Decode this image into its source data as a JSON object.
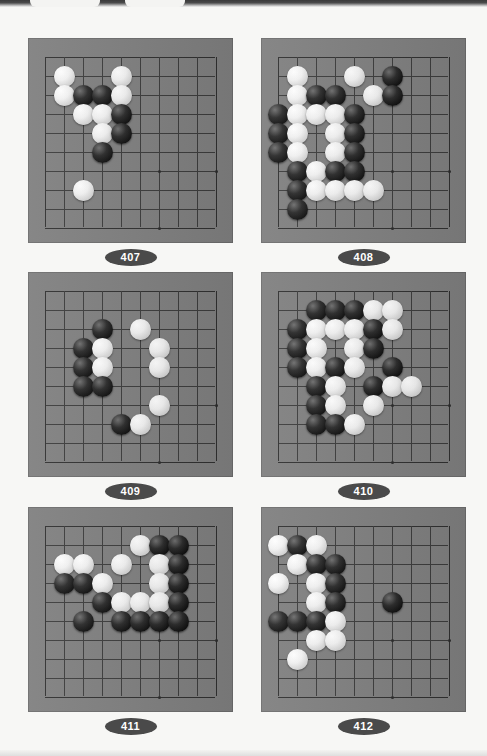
{
  "page": {
    "background_color": "#f7f7f5",
    "board_color": "#7f7f7f",
    "line_color": "#3b3b3b",
    "label_pill_color": "#4a4a4a",
    "label_text_color": "#ffffff",
    "black_stone_color": "#0c0c0c",
    "white_stone_color": "#f2f2f2"
  },
  "board_spec": {
    "cols": 10,
    "rows": 10,
    "cell_px": 19,
    "note": "Each diagram shows a 10x10 visible section of a Go board with a corner/edge area."
  },
  "problems": [
    {
      "number": "407",
      "label": "407",
      "stones": [
        {
          "color": "white",
          "col": 1,
          "row": 1
        },
        {
          "color": "white",
          "col": 4,
          "row": 1
        },
        {
          "color": "white",
          "col": 1,
          "row": 2
        },
        {
          "color": "black",
          "col": 2,
          "row": 2
        },
        {
          "color": "black",
          "col": 3,
          "row": 2
        },
        {
          "color": "white",
          "col": 4,
          "row": 2
        },
        {
          "color": "white",
          "col": 2,
          "row": 3
        },
        {
          "color": "white",
          "col": 3,
          "row": 3
        },
        {
          "color": "black",
          "col": 4,
          "row": 3
        },
        {
          "color": "white",
          "col": 3,
          "row": 4
        },
        {
          "color": "black",
          "col": 4,
          "row": 4
        },
        {
          "color": "black",
          "col": 3,
          "row": 5
        },
        {
          "color": "white",
          "col": 2,
          "row": 7
        }
      ]
    },
    {
      "number": "408",
      "label": "408",
      "stones": [
        {
          "color": "white",
          "col": 1,
          "row": 1
        },
        {
          "color": "white",
          "col": 4,
          "row": 1
        },
        {
          "color": "black",
          "col": 6,
          "row": 1
        },
        {
          "color": "white",
          "col": 1,
          "row": 2
        },
        {
          "color": "black",
          "col": 2,
          "row": 2
        },
        {
          "color": "black",
          "col": 3,
          "row": 2
        },
        {
          "color": "white",
          "col": 5,
          "row": 2
        },
        {
          "color": "black",
          "col": 6,
          "row": 2
        },
        {
          "color": "black",
          "col": 0,
          "row": 3
        },
        {
          "color": "white",
          "col": 1,
          "row": 3
        },
        {
          "color": "white",
          "col": 2,
          "row": 3
        },
        {
          "color": "white",
          "col": 3,
          "row": 3
        },
        {
          "color": "black",
          "col": 4,
          "row": 3
        },
        {
          "color": "black",
          "col": 0,
          "row": 4
        },
        {
          "color": "white",
          "col": 1,
          "row": 4
        },
        {
          "color": "white",
          "col": 3,
          "row": 4
        },
        {
          "color": "black",
          "col": 4,
          "row": 4
        },
        {
          "color": "black",
          "col": 0,
          "row": 5
        },
        {
          "color": "white",
          "col": 1,
          "row": 5
        },
        {
          "color": "white",
          "col": 3,
          "row": 5
        },
        {
          "color": "black",
          "col": 4,
          "row": 5
        },
        {
          "color": "black",
          "col": 1,
          "row": 6
        },
        {
          "color": "white",
          "col": 2,
          "row": 6
        },
        {
          "color": "black",
          "col": 3,
          "row": 6
        },
        {
          "color": "black",
          "col": 4,
          "row": 6
        },
        {
          "color": "black",
          "col": 1,
          "row": 7
        },
        {
          "color": "white",
          "col": 2,
          "row": 7
        },
        {
          "color": "white",
          "col": 3,
          "row": 7
        },
        {
          "color": "white",
          "col": 4,
          "row": 7
        },
        {
          "color": "white",
          "col": 5,
          "row": 7
        },
        {
          "color": "black",
          "col": 1,
          "row": 8
        }
      ]
    },
    {
      "number": "409",
      "label": "409",
      "stones": [
        {
          "color": "black",
          "col": 3,
          "row": 2
        },
        {
          "color": "white",
          "col": 5,
          "row": 2
        },
        {
          "color": "black",
          "col": 2,
          "row": 3
        },
        {
          "color": "white",
          "col": 3,
          "row": 3
        },
        {
          "color": "white",
          "col": 6,
          "row": 3
        },
        {
          "color": "black",
          "col": 2,
          "row": 4
        },
        {
          "color": "white",
          "col": 3,
          "row": 4
        },
        {
          "color": "white",
          "col": 6,
          "row": 4
        },
        {
          "color": "black",
          "col": 2,
          "row": 5
        },
        {
          "color": "black",
          "col": 3,
          "row": 5
        },
        {
          "color": "white",
          "col": 6,
          "row": 6
        },
        {
          "color": "black",
          "col": 4,
          "row": 7
        },
        {
          "color": "white",
          "col": 5,
          "row": 7
        }
      ]
    },
    {
      "number": "410",
      "label": "410",
      "stones": [
        {
          "color": "black",
          "col": 2,
          "row": 1
        },
        {
          "color": "black",
          "col": 3,
          "row": 1
        },
        {
          "color": "black",
          "col": 4,
          "row": 1
        },
        {
          "color": "white",
          "col": 5,
          "row": 1
        },
        {
          "color": "white",
          "col": 6,
          "row": 1
        },
        {
          "color": "black",
          "col": 1,
          "row": 2
        },
        {
          "color": "white",
          "col": 2,
          "row": 2
        },
        {
          "color": "white",
          "col": 3,
          "row": 2
        },
        {
          "color": "white",
          "col": 4,
          "row": 2
        },
        {
          "color": "black",
          "col": 5,
          "row": 2
        },
        {
          "color": "white",
          "col": 6,
          "row": 2
        },
        {
          "color": "black",
          "col": 1,
          "row": 3
        },
        {
          "color": "white",
          "col": 2,
          "row": 3
        },
        {
          "color": "white",
          "col": 4,
          "row": 3
        },
        {
          "color": "black",
          "col": 5,
          "row": 3
        },
        {
          "color": "black",
          "col": 1,
          "row": 4
        },
        {
          "color": "white",
          "col": 2,
          "row": 4
        },
        {
          "color": "black",
          "col": 3,
          "row": 4
        },
        {
          "color": "white",
          "col": 4,
          "row": 4
        },
        {
          "color": "black",
          "col": 6,
          "row": 4
        },
        {
          "color": "black",
          "col": 2,
          "row": 5
        },
        {
          "color": "white",
          "col": 3,
          "row": 5
        },
        {
          "color": "black",
          "col": 5,
          "row": 5
        },
        {
          "color": "white",
          "col": 6,
          "row": 5
        },
        {
          "color": "white",
          "col": 7,
          "row": 5
        },
        {
          "color": "black",
          "col": 2,
          "row": 6
        },
        {
          "color": "white",
          "col": 3,
          "row": 6
        },
        {
          "color": "white",
          "col": 5,
          "row": 6
        },
        {
          "color": "black",
          "col": 2,
          "row": 7
        },
        {
          "color": "black",
          "col": 3,
          "row": 7
        },
        {
          "color": "white",
          "col": 4,
          "row": 7
        }
      ]
    },
    {
      "number": "411",
      "label": "411",
      "stones": [
        {
          "color": "white",
          "col": 5,
          "row": 1
        },
        {
          "color": "black",
          "col": 6,
          "row": 1
        },
        {
          "color": "black",
          "col": 7,
          "row": 1
        },
        {
          "color": "white",
          "col": 1,
          "row": 2
        },
        {
          "color": "white",
          "col": 2,
          "row": 2
        },
        {
          "color": "white",
          "col": 4,
          "row": 2
        },
        {
          "color": "white",
          "col": 6,
          "row": 2
        },
        {
          "color": "black",
          "col": 7,
          "row": 2
        },
        {
          "color": "black",
          "col": 1,
          "row": 3
        },
        {
          "color": "black",
          "col": 2,
          "row": 3
        },
        {
          "color": "white",
          "col": 3,
          "row": 3
        },
        {
          "color": "white",
          "col": 6,
          "row": 3
        },
        {
          "color": "black",
          "col": 7,
          "row": 3
        },
        {
          "color": "black",
          "col": 3,
          "row": 4
        },
        {
          "color": "white",
          "col": 4,
          "row": 4
        },
        {
          "color": "white",
          "col": 5,
          "row": 4
        },
        {
          "color": "white",
          "col": 6,
          "row": 4
        },
        {
          "color": "black",
          "col": 7,
          "row": 4
        },
        {
          "color": "black",
          "col": 2,
          "row": 5
        },
        {
          "color": "black",
          "col": 4,
          "row": 5
        },
        {
          "color": "black",
          "col": 5,
          "row": 5
        },
        {
          "color": "black",
          "col": 6,
          "row": 5
        },
        {
          "color": "black",
          "col": 7,
          "row": 5
        }
      ]
    },
    {
      "number": "412",
      "label": "412",
      "stones": [
        {
          "color": "white",
          "col": 0,
          "row": 1
        },
        {
          "color": "black",
          "col": 1,
          "row": 1
        },
        {
          "color": "white",
          "col": 2,
          "row": 1
        },
        {
          "color": "white",
          "col": 1,
          "row": 2
        },
        {
          "color": "black",
          "col": 2,
          "row": 2
        },
        {
          "color": "black",
          "col": 3,
          "row": 2
        },
        {
          "color": "white",
          "col": 0,
          "row": 3
        },
        {
          "color": "white",
          "col": 2,
          "row": 3
        },
        {
          "color": "black",
          "col": 3,
          "row": 3
        },
        {
          "color": "white",
          "col": 2,
          "row": 4
        },
        {
          "color": "black",
          "col": 3,
          "row": 4
        },
        {
          "color": "black",
          "col": 6,
          "row": 4
        },
        {
          "color": "black",
          "col": 0,
          "row": 5
        },
        {
          "color": "black",
          "col": 1,
          "row": 5
        },
        {
          "color": "black",
          "col": 2,
          "row": 5
        },
        {
          "color": "white",
          "col": 3,
          "row": 5
        },
        {
          "color": "white",
          "col": 2,
          "row": 6
        },
        {
          "color": "white",
          "col": 3,
          "row": 6
        },
        {
          "color": "white",
          "col": 1,
          "row": 7
        }
      ]
    }
  ]
}
